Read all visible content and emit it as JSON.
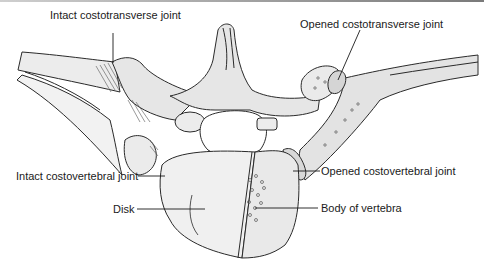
{
  "figure": {
    "labels": {
      "intact_costotransverse": "Intact costotransverse joint",
      "opened_costotransverse": "Opened costotransverse joint",
      "intact_costovertebral": "Intact costovertebral joint",
      "disk": "Disk",
      "opened_costovertebral": "Opened costovertebral joint",
      "body_of_vertebra": "Body of vertebra"
    },
    "colors": {
      "outline": "#2a2a2a",
      "bone_fill": "#e6e6e6",
      "light_fill": "#f1f1f1",
      "background": "#ffffff"
    }
  }
}
